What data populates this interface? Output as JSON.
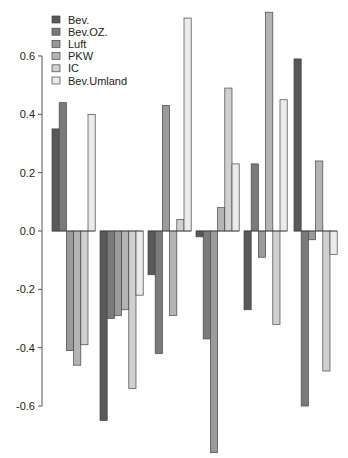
{
  "chart_data": {
    "type": "bar",
    "title": "",
    "xlabel": "",
    "ylabel": "",
    "ylim": [
      -0.6,
      0.6
    ],
    "y_ticks": [
      -0.6,
      -0.4,
      -0.2,
      0.0,
      0.2,
      0.4,
      0.6
    ],
    "y_tick_labels": [
      "-0.6",
      "-0.4",
      "-0.2",
      "0.0",
      "0.2",
      "0.4",
      "0.6"
    ],
    "grid": false,
    "legend_position": "top-left",
    "categories": [
      "1",
      "2",
      "3",
      "4",
      "5",
      "6"
    ],
    "show_category_labels": false,
    "series": [
      {
        "name": "Bev.",
        "color": "#595959",
        "values": [
          0.35,
          -0.65,
          -0.15,
          -0.02,
          -0.27,
          0.59
        ]
      },
      {
        "name": "Bev.OZ.",
        "color": "#7a7a7a",
        "values": [
          0.44,
          -0.3,
          -0.42,
          -0.37,
          0.23,
          -0.6
        ]
      },
      {
        "name": "Luft",
        "color": "#9a9a9a",
        "values": [
          -0.41,
          -0.29,
          0.43,
          -0.76,
          -0.09,
          -0.03
        ]
      },
      {
        "name": "PKW",
        "color": "#b4b4b4",
        "values": [
          -0.46,
          -0.27,
          -0.29,
          0.08,
          0.75,
          0.24
        ]
      },
      {
        "name": "IC",
        "color": "#d0d0d0",
        "values": [
          -0.39,
          -0.54,
          0.04,
          0.49,
          -0.32,
          -0.48
        ]
      },
      {
        "name": "Bev.Umland",
        "color": "#ebebeb",
        "values": [
          0.4,
          -0.22,
          0.73,
          0.23,
          0.45,
          -0.08
        ]
      }
    ]
  }
}
